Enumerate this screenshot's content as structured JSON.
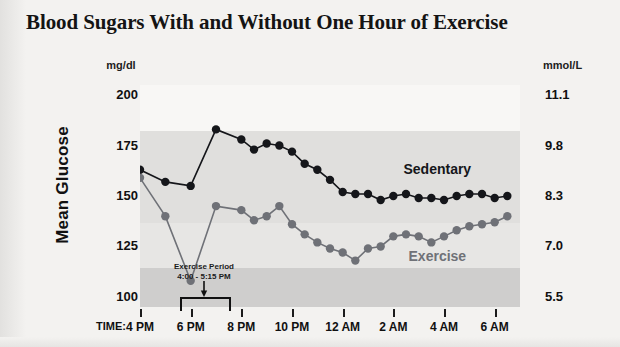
{
  "title": "Blood Sugars With and Without One Hour of Exercise",
  "axes": {
    "left_unit": "mg/dl",
    "right_unit": "mmol/L",
    "y_label": "Mean Glucose",
    "time_label": "TIME:"
  },
  "annotation": {
    "line1": "Exercise Period",
    "line2": "4:00 - 5:15 PM"
  },
  "legend": {
    "sedentary": "Sedentary",
    "exercise": "Exercise"
  },
  "colors": {
    "sedentary": "#15161a",
    "exercise": "#6f7177",
    "text": "#101010",
    "background": "#f3f2f0",
    "band_light": "#f7f6f4",
    "band_mid": "#dedddb",
    "band_dark": "#cdcccb"
  },
  "chart_data": {
    "type": "line",
    "title": "Blood Sugars With and Without One Hour of Exercise",
    "xlabel": "TIME:",
    "ylabel": "Mean Glucose",
    "grid": false,
    "legend_position": "inline-right",
    "ylim": [
      95,
      205
    ],
    "yticks": [
      100,
      125,
      150,
      175,
      200
    ],
    "ytick_labels": [
      "100",
      "125",
      "150",
      "175",
      "200"
    ],
    "y2_unit": "mmol/L",
    "y2tick_labels": [
      "5.5",
      "7.0",
      "8.3",
      "9.8",
      "11.1"
    ],
    "xlim": [
      16,
      31
    ],
    "xticks": [
      16,
      18,
      20,
      22,
      24,
      26,
      28,
      30
    ],
    "xtick_labels": [
      "4 PM",
      "6 PM",
      "8 PM",
      "10 PM",
      "12 AM",
      "2 AM",
      "4 AM",
      "6 AM"
    ],
    "x": [
      16,
      17,
      18,
      19,
      20,
      20.5,
      21,
      21.5,
      22,
      22.5,
      23,
      23.5,
      24,
      24.5,
      25,
      25.5,
      26,
      26.5,
      27,
      27.5,
      28,
      28.5,
      29,
      29.5,
      30,
      30.5
    ],
    "series": [
      {
        "name": "Sedentary",
        "color": "#15161a",
        "values": [
          163,
          157,
          155,
          183,
          178,
          173,
          176,
          175,
          172,
          166,
          163,
          158,
          152,
          151,
          151,
          148,
          150,
          151,
          149,
          149,
          148,
          150,
          151,
          151,
          149,
          150
        ]
      },
      {
        "name": "Exercise",
        "color": "#6f7177",
        "values": [
          159,
          140,
          108,
          145,
          143,
          138,
          140,
          145,
          136,
          131,
          127,
          124,
          122,
          118,
          124,
          125,
          130,
          131,
          130,
          127,
          130,
          133,
          135,
          136,
          137,
          140
        ]
      }
    ],
    "annotations": [
      {
        "text": "Exercise Period 4:00 - 5:15 PM",
        "x_range": [
          16,
          17.25
        ]
      }
    ]
  }
}
